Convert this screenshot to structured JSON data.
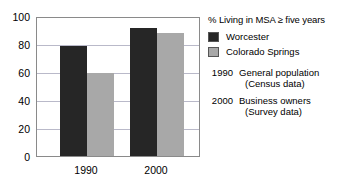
{
  "chart_data": {
    "type": "bar",
    "title": "% Living in MSA ≥ five years",
    "xlabel": "",
    "ylabel": "",
    "categories": [
      "1990",
      "2000"
    ],
    "series": [
      {
        "name": "Worcester",
        "values": [
          80,
          93
        ],
        "color": "#262626"
      },
      {
        "name": "Colorado Springs",
        "values": [
          60,
          89
        ],
        "color": "#a8a8a8"
      }
    ],
    "ylim": [
      0,
      100
    ],
    "yticks": [
      0,
      20,
      40,
      60,
      80,
      100
    ],
    "ytick_labels": [
      "0",
      "20",
      "40",
      "60",
      "80",
      "100"
    ],
    "grid": true,
    "legend_position": "right"
  },
  "legend": {
    "title": "% Living in MSA ≥ five years",
    "entries": [
      {
        "label": "Worcester",
        "swatch": "dark-swatch"
      },
      {
        "label": "Colorado Springs",
        "swatch": "gray-swatch"
      }
    ]
  },
  "notes": [
    {
      "year": "1990",
      "line1": "General population",
      "line2": "(Census data)"
    },
    {
      "year": "2000",
      "line1": "Business owners",
      "line2": "(Survey data)"
    }
  ],
  "axis": {
    "y_labels": [
      "100",
      "80",
      "60",
      "40",
      "20",
      "0"
    ],
    "x_labels": [
      "1990",
      "2000"
    ]
  }
}
